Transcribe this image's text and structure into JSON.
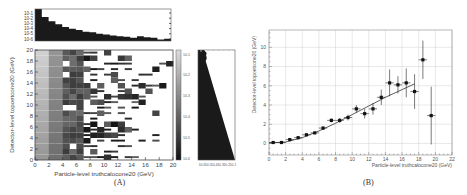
{
  "chart_data": [
    {
      "panel": "A",
      "type": "heatmap",
      "caption": "(A)",
      "xlabel": "Particle-level truthcalocone20 (GeV)",
      "ylabel": "Detector-level topoetcone20 (GeV)",
      "xlim": [
        0,
        20
      ],
      "ylim": [
        0,
        20
      ],
      "xticks": [
        "0",
        "2",
        "4",
        "6",
        "8",
        "10",
        "12",
        "14",
        "16",
        "18",
        "20"
      ],
      "yticks": [
        "0",
        "2",
        "4",
        "6",
        "8",
        "10",
        "12",
        "14",
        "16",
        "18",
        "20"
      ],
      "colorbar": {
        "scale": "log",
        "ticks": [
          "10^-1",
          "10^-2",
          "10^-3",
          "10^-4",
          "10^-5",
          "10^-6"
        ]
      },
      "top_histogram": {
        "scale": "log",
        "yticks": [
          "10^-1",
          "10^-2",
          "10^-3",
          "10^-4",
          "10^-5",
          "10^-6"
        ],
        "relative_heights": [
          1.0,
          0.75,
          0.62,
          0.52,
          0.44,
          0.38,
          0.34,
          0.29,
          0.27,
          0.23,
          0.2,
          0.17,
          0.15,
          0.13,
          0.1,
          0.15,
          0.12,
          0.1,
          0.05,
          0.07
        ]
      },
      "right_histogram": {
        "scale": "log",
        "xticks": [
          "10^-6",
          "10^-5",
          "10^-4",
          "10^-3",
          "10^-2",
          "10^-1"
        ]
      },
      "grid": false
    },
    {
      "panel": "B",
      "type": "scatter",
      "caption": "(B)",
      "xlabel": "Particle-level truthcalocone20 (GeV)",
      "ylabel": "Detector-level topoetcone20 (GeV)",
      "xlim": [
        0,
        22
      ],
      "ylim": [
        -1.2,
        11.8
      ],
      "xticks": [
        "0",
        "2",
        "4",
        "6",
        "8",
        "10",
        "12",
        "14",
        "16",
        "18",
        "20",
        "22"
      ],
      "yticks": [
        "0",
        "2",
        "4",
        "6",
        "8",
        "10"
      ],
      "grid": true,
      "series": [
        {
          "name": "profile",
          "x": [
            0.5,
            1.5,
            2.5,
            3.5,
            4.5,
            5.5,
            6.5,
            7.5,
            8.5,
            9.5,
            10.5,
            11.5,
            12.5,
            13.5,
            14.5,
            15.5,
            16.5,
            17.5,
            18.5,
            19.5
          ],
          "y": [
            0.1,
            0.1,
            0.4,
            0.6,
            0.9,
            1.1,
            1.6,
            2.4,
            2.4,
            2.7,
            3.6,
            3.1,
            3.6,
            4.8,
            6.3,
            6.1,
            6.3,
            5.4,
            8.7,
            2.9
          ],
          "yerr": [
            0.05,
            0.05,
            0.05,
            0.1,
            0.1,
            0.1,
            0.15,
            0.2,
            0.25,
            0.3,
            0.4,
            0.5,
            0.6,
            0.8,
            1.4,
            0.9,
            1.5,
            1.8,
            2.0,
            3.0
          ]
        },
        {
          "name": "fit",
          "type": "line",
          "x": [
            0,
            2,
            4,
            6,
            8,
            10,
            12,
            14,
            16,
            17.5
          ],
          "y": [
            0.05,
            0.15,
            0.6,
            1.3,
            2.1,
            3.0,
            3.9,
            4.8,
            5.6,
            6.2
          ]
        }
      ]
    }
  ],
  "captions": {
    "a": "(A)",
    "b": "(B)"
  },
  "labels": {
    "a_xlabel": "Particle-level truthcalocone20 (GeV)",
    "a_ylabel": "Detector-level topoetcone20 (GeV)",
    "b_xlabel": "Particle-level truthcalocone20 (GeV)",
    "b_ylabel": "Detector-level topoetcone20 (GeV)"
  }
}
